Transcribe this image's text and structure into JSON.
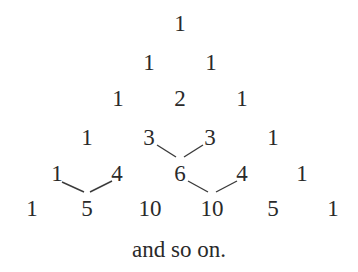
{
  "rows": [
    {
      "y": 23,
      "cells": [
        {
          "v": "1",
          "x": 180
        }
      ]
    },
    {
      "y": 62,
      "cells": [
        {
          "v": "1",
          "x": 149
        },
        {
          "v": "1",
          "x": 211
        }
      ]
    },
    {
      "y": 98,
      "cells": [
        {
          "v": "1",
          "x": 118
        },
        {
          "v": "2",
          "x": 180
        },
        {
          "v": "1",
          "x": 242
        }
      ]
    },
    {
      "y": 137,
      "cells": [
        {
          "v": "1",
          "x": 87
        },
        {
          "v": "3",
          "x": 149
        },
        {
          "v": "3",
          "x": 210
        },
        {
          "v": "1",
          "x": 273
        }
      ]
    },
    {
      "y": 173,
      "cells": [
        {
          "v": "1",
          "x": 57
        },
        {
          "v": "4",
          "x": 117
        },
        {
          "v": "6",
          "x": 180
        },
        {
          "v": "4",
          "x": 242
        },
        {
          "v": "1",
          "x": 302
        }
      ]
    },
    {
      "y": 208,
      "cells": [
        {
          "v": "1",
          "x": 32
        },
        {
          "v": "5",
          "x": 87
        },
        {
          "v": "10",
          "x": 150
        },
        {
          "v": "10",
          "x": 212
        },
        {
          "v": "5",
          "x": 273
        },
        {
          "v": "1",
          "x": 333
        }
      ]
    }
  ],
  "connectors": [
    {
      "from": "3",
      "to": "6",
      "x1": 157,
      "y1": 145,
      "x2": 176,
      "y2": 157
    },
    {
      "from": "3",
      "to": "6",
      "x1": 203,
      "y1": 145,
      "x2": 184,
      "y2": 157
    },
    {
      "from": "1",
      "to": "5",
      "x1": 62,
      "y1": 182,
      "x2": 84,
      "y2": 192
    },
    {
      "from": "4",
      "to": "5",
      "x1": 112,
      "y1": 181,
      "x2": 90,
      "y2": 192
    },
    {
      "from": "6",
      "to": "10",
      "x1": 188,
      "y1": 181,
      "x2": 208,
      "y2": 192
    },
    {
      "from": "4",
      "to": "10",
      "x1": 237,
      "y1": 181,
      "x2": 216,
      "y2": 192
    }
  ],
  "caption": "and so on.",
  "colors": {
    "text": "#2a2a2a",
    "line": "#3a3a3a",
    "background": "#ffffff"
  }
}
